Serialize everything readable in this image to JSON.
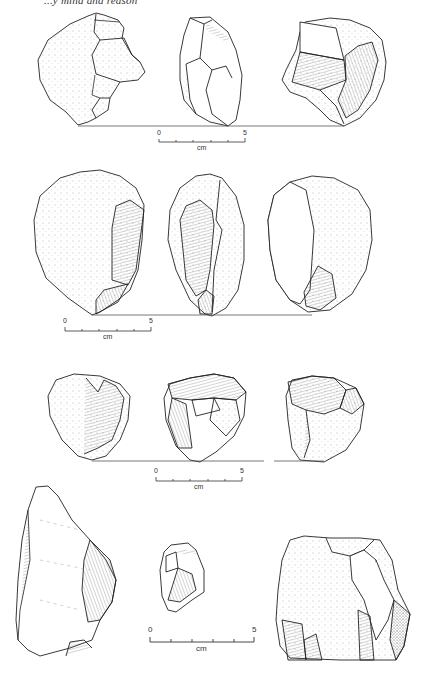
{
  "header": {
    "running_title": "...y mind and reason"
  },
  "plates": [
    {
      "id": "row-1",
      "description": "Three views of a chopper/core with flake scars",
      "scale": {
        "start_label": "0",
        "end_label": "5",
        "unit": "cm"
      }
    },
    {
      "id": "row-2",
      "description": "Three views of a rounded cobble tool with a single flake removal",
      "scale": {
        "start_label": "0",
        "end_label": "5",
        "unit": "cm"
      }
    },
    {
      "id": "row-3",
      "description": "Three views of a small polyhedral core",
      "scale": {
        "start_label": "0",
        "end_label": "5",
        "unit": "cm"
      }
    },
    {
      "id": "row-4",
      "description": "Large flake, small flake, and a flaked block",
      "scale": {
        "start_label": "0",
        "end_label": "5",
        "unit": "cm"
      }
    }
  ]
}
